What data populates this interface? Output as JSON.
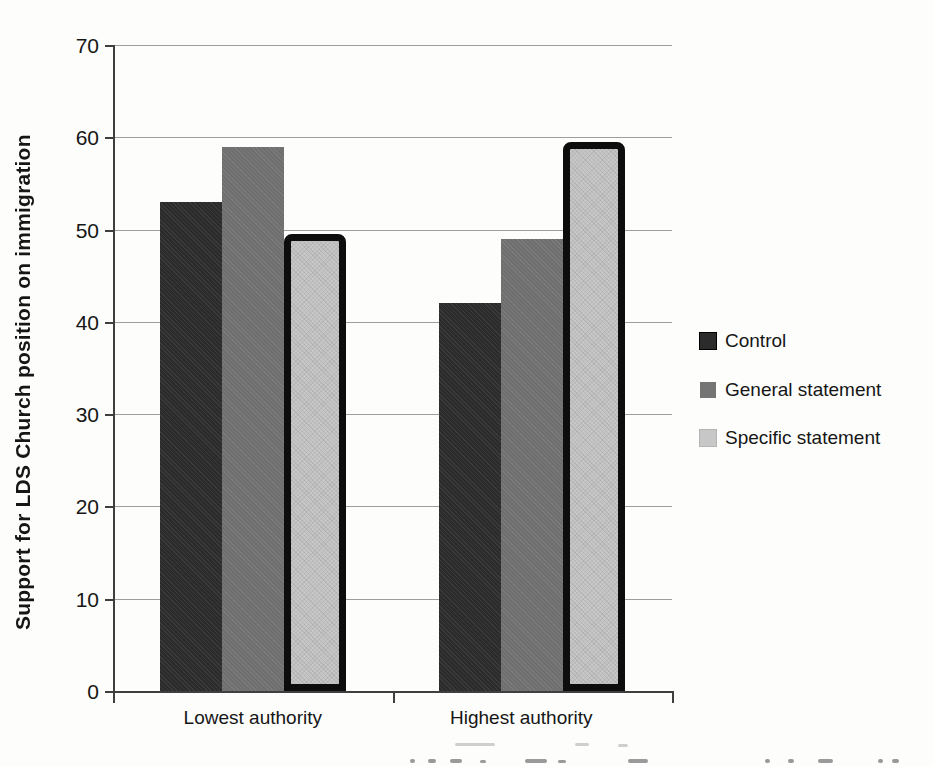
{
  "figure_title": "",
  "chart_data": {
    "type": "bar",
    "title": "",
    "xlabel": "",
    "ylabel": "Support for LDS Church position on immigration",
    "categories": [
      "Lowest authority",
      "Highest authority"
    ],
    "series": [
      {
        "name": "Control",
        "values": [
          53,
          42
        ],
        "color": "#2b2b2b",
        "style": "control",
        "outlined": false
      },
      {
        "name": "General statement",
        "values": [
          59,
          49
        ],
        "color": "#6f6f6f",
        "style": "general",
        "outlined": false
      },
      {
        "name": "Specific statement",
        "values": [
          49.5,
          59.5
        ],
        "color": "#c7c7c7",
        "style": "specific",
        "outlined": true
      }
    ],
    "ylim": [
      0,
      70
    ],
    "yticks": [
      0,
      10,
      20,
      30,
      40,
      50,
      60,
      70
    ],
    "ytick_labels": [
      "0",
      "10",
      "20",
      "30",
      "40",
      "50",
      "60",
      "70"
    ],
    "grid": true,
    "legend_position": "right"
  },
  "colors": {
    "background": "#fdfdfc",
    "gridline": "#7e7e7e",
    "axis": "#3f3f3f",
    "text": "#161616",
    "bar_outline": "#0d0d0d"
  }
}
